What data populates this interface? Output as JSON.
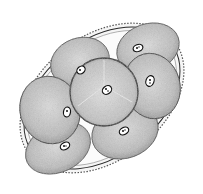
{
  "image": {
    "description": "Stippled ink illustration of an oval egg shell containing cleaving cells (blastomeres), each with a small dark nucleus",
    "width": 203,
    "height": 194,
    "colors": {
      "background": "#ffffff",
      "ink": "#2a2a2a",
      "cell_fill": "#b8b8b8",
      "cell_fill_light": "#d6d6d6",
      "shell_fill": "#f4f4f4"
    },
    "cell_count": 8
  }
}
